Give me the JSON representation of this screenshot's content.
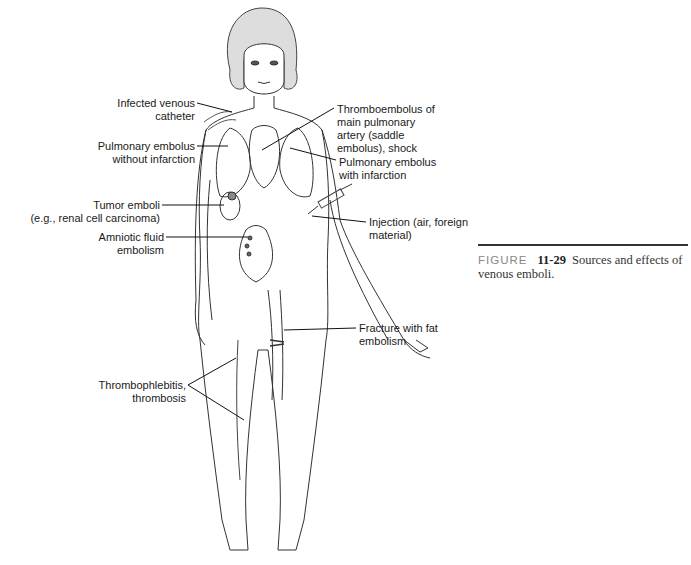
{
  "figure": {
    "caption": {
      "prefix": "FIGURE",
      "number": "11-29",
      "text": "Sources and effects of venous emboli."
    },
    "labels": {
      "infected_catheter": [
        "Infected venous",
        "catheter"
      ],
      "pe_without_infarction": [
        "Pulmonary embolus",
        "without infarction"
      ],
      "tumor_emboli": [
        "Tumor emboli",
        "(e.g., renal cell carcinoma)"
      ],
      "amniotic": [
        "Amniotic fluid",
        "embolism"
      ],
      "thromboembolus": [
        "Thromboembolus of",
        "main pulmonary",
        "artery (saddle",
        "embolus), shock"
      ],
      "pe_with_infarction": [
        "Pulmonary embolus",
        "with infarction"
      ],
      "injection": [
        "Injection (air, foreign",
        "material)"
      ],
      "fracture": [
        "Fracture with fat",
        "embolism"
      ],
      "thrombophlebitis": [
        "Thrombophlebitis,",
        "thrombosis"
      ]
    }
  }
}
